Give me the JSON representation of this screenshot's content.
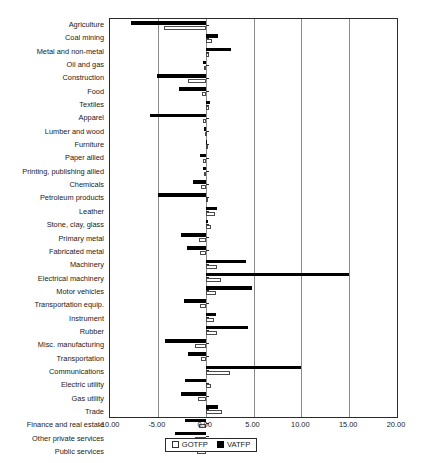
{
  "chart_data": {
    "type": "bar",
    "orientation": "horizontal",
    "title": "",
    "xlabel": "",
    "ylabel": "",
    "xlim": [
      -10.0,
      20.0
    ],
    "xticks": [
      -10.0,
      -5.0,
      0.0,
      5.0,
      10.0,
      15.0,
      20.0
    ],
    "xtick_labels": [
      "-10.00",
      "-5.00",
      "0.00",
      "5.00",
      "10.00",
      "15.00",
      "20.00"
    ],
    "grid": true,
    "grid_axis": "x",
    "legend_position": "bottom-center",
    "categories": [
      "Agriculture",
      "Coal mining",
      "Metal and non-metal",
      "Oil and gas",
      "Construction",
      "Food",
      "Textiles",
      "Apparel",
      "Lumber and wood",
      "Furniture",
      "Paper allied",
      "Printing, publishing allied",
      "Chemicals",
      "Petroleum products",
      "Leather",
      "Stone, clay, glass",
      "Primary metal",
      "Fabricated metal",
      "Machinery",
      "Electrical machinery",
      "Motor vehicles",
      "Transportation equip.",
      "Instrument",
      "Rubber",
      "Misc. manufacturing",
      "Transportation",
      "Communications",
      "Electric utility",
      "Gas utility",
      "Trade",
      "Finance and real estate",
      "Other private services",
      "Public services"
    ],
    "series": [
      {
        "name": "GOTFP",
        "style": "open-square",
        "color": "#ffffff",
        "edge_color": "#4a4a4a",
        "values": [
          -4.4,
          0.7,
          0.4,
          -0.15,
          -1.8,
          -0.4,
          0.35,
          -0.25,
          -0.1,
          0.05,
          -0.3,
          -0.15,
          -0.45,
          0.15,
          1.0,
          0.55,
          -0.7,
          -0.55,
          1.15,
          1.6,
          1.1,
          -0.6,
          0.85,
          1.2,
          -1.1,
          -0.5,
          2.5,
          0.55,
          -0.8,
          1.7,
          -0.7,
          -1.1,
          -0.9
        ]
      },
      {
        "name": "VATFP",
        "style": "filled-square",
        "color": "#000000",
        "edge_color": "#000000",
        "values": [
          -7.8,
          1.3,
          2.7,
          -0.3,
          -5.1,
          -2.8,
          0.5,
          -5.8,
          -0.2,
          0.1,
          -0.6,
          -0.3,
          -1.3,
          -5.0,
          1.2,
          0.25,
          -2.6,
          -2.0,
          4.2,
          15.0,
          4.8,
          -2.3,
          1.1,
          4.4,
          -4.3,
          -1.8,
          10.0,
          -2.2,
          -2.6,
          1.3,
          -2.2,
          -3.2,
          -2.2
        ]
      }
    ],
    "legend": [
      {
        "label": "GOTFP",
        "marker": "open-square"
      },
      {
        "label": "VATFP",
        "marker": "filled-square"
      }
    ]
  }
}
